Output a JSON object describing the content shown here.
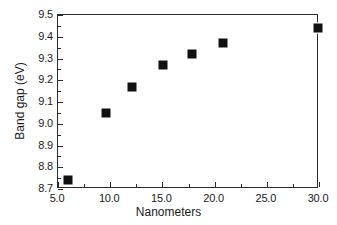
{
  "chart_data": {
    "type": "scatter",
    "title": "",
    "xlabel": "Nanometers",
    "ylabel": "Band gap (eV)",
    "xlim": [
      5.0,
      30.0
    ],
    "ylim": [
      8.7,
      9.5
    ],
    "xticks": [
      "5.0",
      "10.0",
      "15.0",
      "20.0",
      "25.0",
      "30.0"
    ],
    "xtick_values": [
      5.0,
      10.0,
      15.0,
      20.0,
      25.0,
      30.0
    ],
    "yticks": [
      "8.7",
      "8.8",
      "8.9",
      "9.0",
      "9.1",
      "9.2",
      "9.3",
      "9.4",
      "9.5"
    ],
    "ytick_values": [
      8.7,
      8.8,
      8.9,
      9.0,
      9.1,
      9.2,
      9.3,
      9.4,
      9.5
    ],
    "grid": false,
    "legend": false,
    "marker": "filled-square",
    "marker_color": "#111111",
    "frame_color": "#2b2b2b",
    "background": "#ffffff",
    "x": [
      6.0,
      9.6,
      12.1,
      15.1,
      17.8,
      20.8,
      29.9
    ],
    "y": [
      8.74,
      9.05,
      9.17,
      9.27,
      9.32,
      9.37,
      9.44
    ],
    "points": [
      {
        "x": 6.0,
        "y": 8.74
      },
      {
        "x": 9.6,
        "y": 9.05
      },
      {
        "x": 12.1,
        "y": 9.17
      },
      {
        "x": 15.1,
        "y": 9.27
      },
      {
        "x": 17.8,
        "y": 9.32
      },
      {
        "x": 20.8,
        "y": 9.37
      },
      {
        "x": 29.9,
        "y": 9.44
      }
    ]
  }
}
